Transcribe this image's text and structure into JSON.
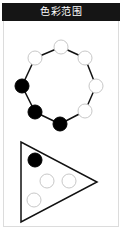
{
  "header": {
    "title": "色彩范围"
  },
  "ring": {
    "circles": [
      {
        "cx": 61,
        "cy": 47,
        "fill": "white"
      },
      {
        "cx": 85,
        "cy": 58,
        "fill": "white"
      },
      {
        "cx": 96,
        "cy": 86,
        "fill": "white"
      },
      {
        "cx": 85,
        "cy": 111,
        "fill": "white"
      },
      {
        "cx": 60,
        "cy": 124,
        "fill": "black"
      },
      {
        "cx": 35,
        "cy": 112,
        "fill": "black"
      },
      {
        "cx": 22,
        "cy": 86,
        "fill": "black"
      },
      {
        "cx": 35,
        "cy": 58,
        "fill": "white"
      }
    ]
  },
  "triangle": {
    "points": "21,142 21,222 97,182",
    "circles": [
      {
        "cx": 35,
        "cy": 160,
        "fill": "black"
      },
      {
        "cx": 47,
        "cy": 181,
        "fill": "white"
      },
      {
        "cx": 69,
        "cy": 181,
        "fill": "white"
      },
      {
        "cx": 34,
        "cy": 200,
        "fill": "white"
      }
    ]
  },
  "colors": {
    "filled": "#000000",
    "empty": "#ffffff",
    "emptyStroke": "#c8c8c8",
    "line": "#111111"
  }
}
